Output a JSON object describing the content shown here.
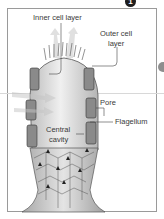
{
  "figure": {
    "marker": "1"
  },
  "labels": {
    "inner_cell_layer": "Inner cell layer",
    "outer_cell_layer_1": "Outer cell",
    "outer_cell_layer_2": "layer",
    "pore": "Pore",
    "flagellum": "Flagellum",
    "central_cavity_1": "Central",
    "central_cavity_2": "cavity"
  },
  "colors": {
    "frame": "#9a9a9a",
    "body_fill": "#d6d6d6",
    "cells": "#555555",
    "label_text": "#3a3a3a"
  }
}
